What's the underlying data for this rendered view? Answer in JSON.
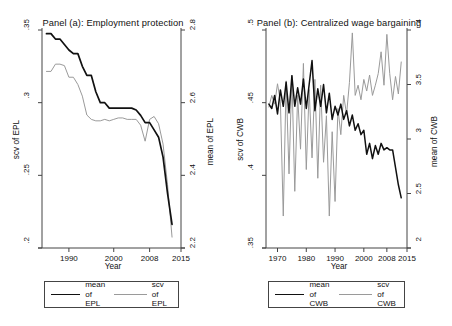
{
  "figure": {
    "background": "#ffffff",
    "series_colors": {
      "mean": "#111111",
      "scv": "#9a9a9a"
    }
  },
  "chart_data": [
    {
      "type": "line",
      "title": "Panel (a): Employment protection",
      "xlabel": "Year",
      "ylabel": "scv of EPL",
      "y2label": "mean of EPL",
      "grid": false,
      "legend_position": "below",
      "xlim": [
        1984,
        2015
      ],
      "xticks": [
        "1990",
        "2000",
        "2008",
        "2015"
      ],
      "xtick_values": [
        1990,
        2000,
        2008,
        2015
      ],
      "ylim": [
        0.2,
        0.35
      ],
      "yticks": [
        ".2",
        ".25",
        ".3",
        ".35"
      ],
      "ytick_values": [
        0.2,
        0.25,
        0.3,
        0.35
      ],
      "y2lim": [
        2.2,
        2.8
      ],
      "y2ticks": [
        "2.2",
        "2.4",
        "2.6",
        "2.8"
      ],
      "y2tick_values": [
        2.2,
        2.4,
        2.6,
        2.8
      ],
      "x": [
        1985,
        1986,
        1987,
        1988,
        1989,
        1990,
        1991,
        1992,
        1993,
        1994,
        1995,
        1996,
        1997,
        1998,
        1999,
        2000,
        2001,
        2002,
        2003,
        2004,
        2005,
        2006,
        2007,
        2008,
        2009,
        2010,
        2011,
        2012,
        2013
      ],
      "series": [
        {
          "name": "mean of EPL",
          "axis": "right",
          "color": "#111111",
          "width": 1.7,
          "values": [
            2.79,
            2.79,
            2.775,
            2.775,
            2.76,
            2.745,
            2.735,
            2.735,
            2.7,
            2.675,
            2.675,
            2.63,
            2.6,
            2.6,
            2.585,
            2.585,
            2.585,
            2.585,
            2.585,
            2.585,
            2.58,
            2.565,
            2.545,
            2.545,
            2.525,
            2.505,
            2.45,
            2.35,
            2.265
          ]
        },
        {
          "name": "scv of EPL",
          "axis": "left",
          "color": "#9a9a9a",
          "width": 1.0,
          "values": [
            0.3215,
            0.3215,
            0.3265,
            0.3265,
            0.3255,
            0.3175,
            0.3175,
            0.3125,
            0.3045,
            0.2915,
            0.2885,
            0.2875,
            0.2875,
            0.2885,
            0.2875,
            0.2885,
            0.2895,
            0.2895,
            0.2885,
            0.2885,
            0.2885,
            0.2845,
            0.2735,
            0.2885,
            0.2905,
            0.2855,
            0.2715,
            0.2435,
            0.2075
          ]
        }
      ]
    },
    {
      "type": "line",
      "title": "Panel (b): Centralized wage bargaining",
      "xlabel": "Year",
      "ylabel": "scv of CWB",
      "y2label": "mean of CWB",
      "grid": false,
      "legend_position": "below",
      "xlim": [
        1966,
        2015
      ],
      "xticks": [
        "1970",
        "1980",
        "1990",
        "2000",
        "2008",
        "2015"
      ],
      "xtick_values": [
        1970,
        1980,
        1990,
        2000,
        2008,
        2015
      ],
      "ylim": [
        0.35,
        0.5
      ],
      "yticks": [
        ".35",
        ".4",
        ".45",
        ".5"
      ],
      "ytick_values": [
        0.35,
        0.4,
        0.45,
        0.5
      ],
      "y2lim": [
        2.0,
        4.0
      ],
      "y2ticks": [
        "2",
        "2.5",
        "3",
        "3.5",
        "4"
      ],
      "y2tick_values": [
        2.0,
        2.5,
        3.0,
        3.5,
        4.0
      ],
      "x": [
        1967,
        1968,
        1969,
        1970,
        1971,
        1972,
        1973,
        1974,
        1975,
        1976,
        1977,
        1978,
        1979,
        1980,
        1981,
        1982,
        1983,
        1984,
        1985,
        1986,
        1987,
        1988,
        1989,
        1990,
        1991,
        1992,
        1993,
        1994,
        1995,
        1996,
        1997,
        1998,
        1999,
        2000,
        2001,
        2002,
        2003,
        2004,
        2005,
        2006,
        2007,
        2008,
        2009,
        2010,
        2011,
        2012,
        2013
      ],
      "series": [
        {
          "name": "mean of CWB",
          "axis": "right",
          "color": "#111111",
          "width": 1.5,
          "values": [
            3.32,
            3.28,
            3.4,
            3.23,
            3.45,
            3.3,
            3.52,
            3.24,
            3.58,
            3.3,
            3.47,
            3.32,
            3.55,
            3.28,
            3.5,
            3.72,
            3.26,
            3.46,
            3.3,
            3.5,
            3.24,
            3.42,
            3.18,
            3.3,
            3.22,
            3.32,
            3.18,
            3.26,
            3.12,
            3.22,
            3.08,
            3.14,
            3.04,
            3.08,
            2.86,
            2.96,
            2.82,
            2.94,
            2.86,
            2.96,
            2.9,
            2.92,
            2.9,
            2.9,
            2.74,
            2.58,
            2.46
          ]
        },
        {
          "name": "scv of CWB",
          "axis": "left",
          "color": "#9a9a9a",
          "width": 1.0,
          "values": [
            0.447,
            0.455,
            0.449,
            0.463,
            0.451,
            0.372,
            0.465,
            0.401,
            0.469,
            0.389,
            0.455,
            0.418,
            0.477,
            0.404,
            0.459,
            0.412,
            0.466,
            0.398,
            0.462,
            0.409,
            0.441,
            0.372,
            0.43,
            0.382,
            0.446,
            0.428,
            0.455,
            0.442,
            0.464,
            0.498,
            0.455,
            0.462,
            0.452,
            0.466,
            0.458,
            0.469,
            0.455,
            0.462,
            0.47,
            0.485,
            0.462,
            0.497,
            0.47,
            0.452,
            0.468,
            0.456,
            0.478
          ]
        }
      ]
    }
  ],
  "legends": [
    {
      "left_label": "mean of\nEPL",
      "right_label": "scv of\nEPL"
    },
    {
      "left_label": "mean of\nCWB",
      "right_label": "scv of\nCWB"
    }
  ]
}
